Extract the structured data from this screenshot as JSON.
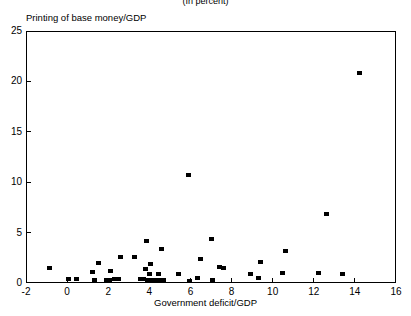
{
  "figure": {
    "supertitle": "(In percent)",
    "y_axis_title": "Printing of base money/GDP",
    "x_axis_title": "Government deficit/GDP"
  },
  "chart_data": {
    "type": "scatter",
    "title": "(In percent)",
    "xlabel": "Government deficit/GDP",
    "ylabel": "Printing of base money/GDP",
    "xlim": [
      -2,
      16
    ],
    "ylim": [
      0,
      25
    ],
    "xticks": [
      -2,
      0,
      2,
      4,
      6,
      8,
      10,
      12,
      14,
      16
    ],
    "yticks": [
      0,
      5,
      10,
      15,
      20,
      25
    ],
    "grid": false,
    "legend": null,
    "marker": "filled-square",
    "marker_color": "#000000",
    "points": [
      {
        "x": -0.85,
        "y": 1.5
      },
      {
        "x": 0.05,
        "y": 0.35
      },
      {
        "x": 0.45,
        "y": 0.35
      },
      {
        "x": 1.25,
        "y": 1.1
      },
      {
        "x": 1.35,
        "y": 0.3
      },
      {
        "x": 1.55,
        "y": 2.0
      },
      {
        "x": 1.9,
        "y": 0.3
      },
      {
        "x": 2.05,
        "y": 0.3
      },
      {
        "x": 2.1,
        "y": 1.2
      },
      {
        "x": 2.3,
        "y": 0.35
      },
      {
        "x": 2.5,
        "y": 0.35
      },
      {
        "x": 2.6,
        "y": 2.6
      },
      {
        "x": 3.3,
        "y": 2.6
      },
      {
        "x": 3.55,
        "y": 0.35
      },
      {
        "x": 3.7,
        "y": 0.35
      },
      {
        "x": 3.8,
        "y": 1.4
      },
      {
        "x": 3.85,
        "y": 4.2
      },
      {
        "x": 3.9,
        "y": 0.3
      },
      {
        "x": 4.0,
        "y": 0.85
      },
      {
        "x": 4.05,
        "y": 1.9
      },
      {
        "x": 4.15,
        "y": 0.3
      },
      {
        "x": 4.35,
        "y": 0.3
      },
      {
        "x": 4.45,
        "y": 0.9
      },
      {
        "x": 4.55,
        "y": 0.3
      },
      {
        "x": 4.6,
        "y": 3.4
      },
      {
        "x": 4.7,
        "y": 0.3
      },
      {
        "x": 5.4,
        "y": 0.9
      },
      {
        "x": 5.9,
        "y": 10.7
      },
      {
        "x": 5.95,
        "y": 0.2
      },
      {
        "x": 6.35,
        "y": 0.45
      },
      {
        "x": 6.5,
        "y": 2.4
      },
      {
        "x": 7.0,
        "y": 4.4
      },
      {
        "x": 7.05,
        "y": 0.25
      },
      {
        "x": 7.4,
        "y": 1.55
      },
      {
        "x": 7.6,
        "y": 1.5
      },
      {
        "x": 8.9,
        "y": 0.9
      },
      {
        "x": 9.3,
        "y": 0.5
      },
      {
        "x": 9.4,
        "y": 2.1
      },
      {
        "x": 10.5,
        "y": 1.0
      },
      {
        "x": 10.6,
        "y": 3.2
      },
      {
        "x": 12.25,
        "y": 0.95
      },
      {
        "x": 12.6,
        "y": 6.85
      },
      {
        "x": 13.4,
        "y": 0.9
      },
      {
        "x": 14.2,
        "y": 20.8
      }
    ]
  }
}
